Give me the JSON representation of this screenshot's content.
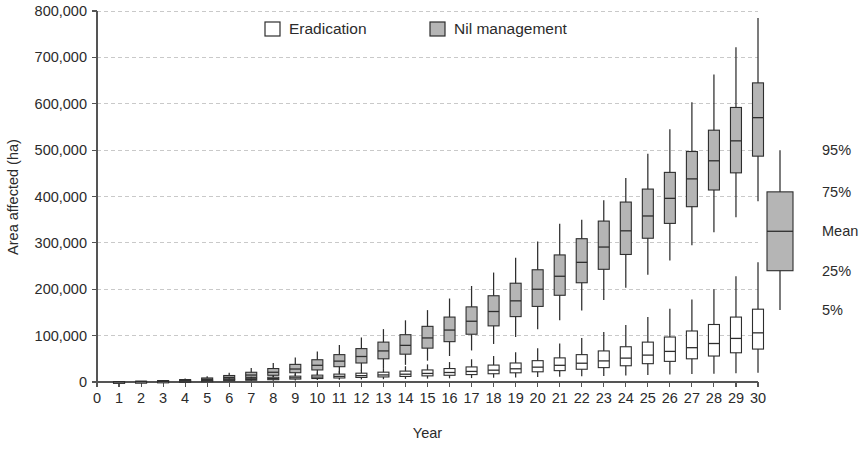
{
  "chart_data": {
    "type": "box",
    "title": "",
    "xlabel": "Year",
    "ylabel": "Area affected (ha)",
    "ylim": [
      0,
      800000
    ],
    "xlim": [
      0,
      30
    ],
    "ytick_labels": [
      "800,000",
      "700,000",
      "600,000",
      "500,000",
      "400,000",
      "300,000",
      "200,000",
      "100,000",
      "0"
    ],
    "ytick_values": [
      800000,
      700000,
      600000,
      500000,
      400000,
      300000,
      200000,
      100000,
      0
    ],
    "xtick_labels": [
      "0",
      "1",
      "2",
      "3",
      "4",
      "5",
      "6",
      "7",
      "8",
      "9",
      "10",
      "11",
      "12",
      "13",
      "14",
      "15",
      "16",
      "17",
      "18",
      "19",
      "20",
      "21",
      "22",
      "23",
      "24",
      "25",
      "26",
      "27",
      "28",
      "29",
      "30"
    ],
    "xtick_values": [
      0,
      1,
      2,
      3,
      4,
      5,
      6,
      7,
      8,
      9,
      10,
      11,
      12,
      13,
      14,
      15,
      16,
      17,
      18,
      19,
      20,
      21,
      22,
      23,
      24,
      25,
      26,
      27,
      28,
      29,
      30
    ],
    "grid": true,
    "legend_position": "top-center",
    "legend": [
      {
        "name": "Eradication",
        "fill": "#ffffff",
        "stroke": "#2e2e2e"
      },
      {
        "name": "Nil management",
        "fill": "#b5b5b5",
        "stroke": "#2e2e2e"
      }
    ],
    "key": {
      "labels": [
        "95%",
        "75%",
        "Mean",
        "25%",
        "5%"
      ],
      "fill": "#b5b5b5",
      "box_low": 240000,
      "box_high": 410000,
      "mean": 325000,
      "whisker_low": 155000,
      "whisker_high": 500000
    },
    "series": [
      {
        "name": "Nil management",
        "fill": "#b5b5b5",
        "stroke": "#2e2e2e",
        "boxes": [
          {
            "x": 1,
            "whisker_low": 200,
            "q25": 400,
            "mean": 600,
            "q75": 900,
            "whisker_high": 1300
          },
          {
            "x": 2,
            "whisker_low": 400,
            "q25": 800,
            "mean": 1200,
            "q75": 1700,
            "whisker_high": 2400
          },
          {
            "x": 3,
            "whisker_low": 700,
            "q25": 1400,
            "mean": 2100,
            "q75": 3000,
            "whisker_high": 4300
          },
          {
            "x": 4,
            "whisker_low": 1200,
            "q25": 2400,
            "mean": 3600,
            "q75": 5200,
            "whisker_high": 7500
          },
          {
            "x": 5,
            "whisker_low": 2000,
            "q25": 4000,
            "mean": 6000,
            "q75": 8700,
            "whisker_high": 12500
          },
          {
            "x": 6,
            "whisker_low": 3200,
            "q25": 6500,
            "mean": 9800,
            "q75": 14000,
            "whisker_high": 20000
          },
          {
            "x": 7,
            "whisker_low": 5000,
            "q25": 10000,
            "mean": 15000,
            "q75": 21000,
            "whisker_high": 30000
          },
          {
            "x": 8,
            "whisker_low": 7500,
            "q25": 14500,
            "mean": 21000,
            "q75": 29000,
            "whisker_high": 41000
          },
          {
            "x": 9,
            "whisker_low": 10500,
            "q25": 20000,
            "mean": 28000,
            "q75": 38000,
            "whisker_high": 53000
          },
          {
            "x": 10,
            "whisker_low": 14000,
            "q25": 26000,
            "mean": 36000,
            "q75": 48000,
            "whisker_high": 66000
          },
          {
            "x": 11,
            "whisker_low": 18500,
            "q25": 33000,
            "mean": 45000,
            "q75": 59000,
            "whisker_high": 80000
          },
          {
            "x": 12,
            "whisker_low": 24000,
            "q25": 41000,
            "mean": 55000,
            "q75": 72000,
            "whisker_high": 96000
          },
          {
            "x": 13,
            "whisker_low": 30000,
            "q25": 50000,
            "mean": 67000,
            "q75": 86000,
            "whisker_high": 114000
          },
          {
            "x": 14,
            "whisker_low": 37000,
            "q25": 60000,
            "mean": 79000,
            "q75": 102000,
            "whisker_high": 133000
          },
          {
            "x": 15,
            "whisker_low": 46000,
            "q25": 73000,
            "mean": 95000,
            "q75": 120000,
            "whisker_high": 155000
          },
          {
            "x": 16,
            "whisker_low": 56000,
            "q25": 87000,
            "mean": 112000,
            "q75": 140000,
            "whisker_high": 180000
          },
          {
            "x": 17,
            "whisker_low": 68000,
            "q25": 103000,
            "mean": 131000,
            "q75": 162000,
            "whisker_high": 207000
          },
          {
            "x": 18,
            "whisker_low": 82000,
            "q25": 121000,
            "mean": 152000,
            "q75": 186000,
            "whisker_high": 236000
          },
          {
            "x": 19,
            "whisker_low": 97000,
            "q25": 141000,
            "mean": 175000,
            "q75": 213000,
            "whisker_high": 268000
          },
          {
            "x": 20,
            "whisker_low": 114000,
            "q25": 163000,
            "mean": 200000,
            "q75": 242000,
            "whisker_high": 303000
          },
          {
            "x": 21,
            "whisker_low": 133000,
            "q25": 187000,
            "mean": 228000,
            "q75": 274000,
            "whisker_high": 341000
          },
          {
            "x": 22,
            "whisker_low": 154000,
            "q25": 214000,
            "mean": 258000,
            "q75": 309000,
            "whisker_high": 350000
          },
          {
            "x": 23,
            "whisker_low": 177000,
            "q25": 243000,
            "mean": 291000,
            "q75": 347000,
            "whisker_high": 392000
          },
          {
            "x": 24,
            "whisker_low": 203000,
            "q25": 275000,
            "mean": 326000,
            "q75": 388000,
            "whisker_high": 440000
          },
          {
            "x": 25,
            "whisker_low": 231000,
            "q25": 310000,
            "mean": 358000,
            "q75": 416000,
            "whisker_high": 492000
          },
          {
            "x": 26,
            "whisker_low": 262000,
            "q25": 342000,
            "mean": 396000,
            "q75": 452000,
            "whisker_high": 545000
          },
          {
            "x": 27,
            "whisker_low": 295000,
            "q25": 378000,
            "mean": 438000,
            "q75": 497000,
            "whisker_high": 603000
          },
          {
            "x": 28,
            "whisker_low": 323000,
            "q25": 414000,
            "mean": 477000,
            "q75": 543000,
            "whisker_high": 663000
          },
          {
            "x": 29,
            "whisker_low": 355000,
            "q25": 451000,
            "mean": 520000,
            "q75": 592000,
            "whisker_high": 722000
          },
          {
            "x": 30,
            "whisker_low": 390000,
            "q25": 487000,
            "mean": 570000,
            "q75": 645000,
            "whisker_high": 785000
          }
        ]
      },
      {
        "name": "Eradication",
        "fill": "#ffffff",
        "stroke": "#2e2e2e",
        "boxes": [
          {
            "x": 1,
            "whisker_low": 100,
            "q25": 200,
            "mean": 300,
            "q75": 450,
            "whisker_high": 650
          },
          {
            "x": 2,
            "whisker_low": 200,
            "q25": 400,
            "mean": 600,
            "q75": 850,
            "whisker_high": 1200
          },
          {
            "x": 3,
            "whisker_low": 350,
            "q25": 700,
            "mean": 1000,
            "q75": 1450,
            "whisker_high": 2100
          },
          {
            "x": 4,
            "whisker_low": 600,
            "q25": 1150,
            "mean": 1700,
            "q75": 2450,
            "whisker_high": 3500
          },
          {
            "x": 5,
            "whisker_low": 900,
            "q25": 1800,
            "mean": 2700,
            "q75": 3900,
            "whisker_high": 5600
          },
          {
            "x": 6,
            "whisker_low": 1400,
            "q25": 2700,
            "mean": 4000,
            "q75": 5800,
            "whisker_high": 8200
          },
          {
            "x": 7,
            "whisker_low": 2000,
            "q25": 3800,
            "mean": 5600,
            "q75": 8000,
            "whisker_high": 11200
          },
          {
            "x": 8,
            "whisker_low": 2700,
            "q25": 5000,
            "mean": 7300,
            "q75": 10300,
            "whisker_high": 14500
          },
          {
            "x": 9,
            "whisker_low": 3400,
            "q25": 6300,
            "mean": 9000,
            "q75": 12600,
            "whisker_high": 17500
          },
          {
            "x": 10,
            "whisker_low": 4100,
            "q25": 7500,
            "mean": 10600,
            "q75": 14800,
            "whisker_high": 20500
          },
          {
            "x": 11,
            "whisker_low": 4800,
            "q25": 8700,
            "mean": 12200,
            "q75": 17000,
            "whisker_high": 23500
          },
          {
            "x": 12,
            "whisker_low": 5500,
            "q25": 9800,
            "mean": 13700,
            "q75": 19000,
            "whisker_high": 26500
          },
          {
            "x": 13,
            "whisker_low": 6100,
            "q25": 10900,
            "mean": 15200,
            "q75": 21200,
            "whisker_high": 30000
          },
          {
            "x": 14,
            "whisker_low": 6700,
            "q25": 12000,
            "mean": 16800,
            "q75": 23500,
            "whisker_high": 34000
          },
          {
            "x": 15,
            "whisker_low": 7300,
            "q25": 13200,
            "mean": 18500,
            "q75": 26000,
            "whisker_high": 38000
          },
          {
            "x": 16,
            "whisker_low": 7900,
            "q25": 14500,
            "mean": 20500,
            "q75": 29000,
            "whisker_high": 43000
          },
          {
            "x": 17,
            "whisker_low": 8500,
            "q25": 16000,
            "mean": 22800,
            "q75": 32500,
            "whisker_high": 49000
          },
          {
            "x": 18,
            "whisker_low": 9200,
            "q25": 17800,
            "mean": 25500,
            "q75": 36500,
            "whisker_high": 56000
          },
          {
            "x": 19,
            "whisker_low": 9900,
            "q25": 19800,
            "mean": 28500,
            "q75": 41000,
            "whisker_high": 64000
          },
          {
            "x": 20,
            "whisker_low": 10600,
            "q25": 22000,
            "mean": 32000,
            "q75": 46000,
            "whisker_high": 73000
          },
          {
            "x": 21,
            "whisker_low": 11400,
            "q25": 24500,
            "mean": 36000,
            "q75": 52000,
            "whisker_high": 83000
          },
          {
            "x": 22,
            "whisker_low": 12200,
            "q25": 27500,
            "mean": 40500,
            "q75": 59000,
            "whisker_high": 95000
          },
          {
            "x": 23,
            "whisker_low": 13000,
            "q25": 31000,
            "mean": 45500,
            "q75": 67000,
            "whisker_high": 108000
          },
          {
            "x": 24,
            "whisker_low": 14000,
            "q25": 35000,
            "mean": 51500,
            "q75": 76000,
            "whisker_high": 123000
          },
          {
            "x": 25,
            "whisker_low": 15000,
            "q25": 39500,
            "mean": 58000,
            "q75": 86000,
            "whisker_high": 140000
          },
          {
            "x": 26,
            "whisker_low": 16000,
            "q25": 44500,
            "mean": 66000,
            "q75": 97000,
            "whisker_high": 158000
          },
          {
            "x": 27,
            "whisker_low": 17000,
            "q25": 50000,
            "mean": 74000,
            "q75": 110000,
            "whisker_high": 178000
          },
          {
            "x": 28,
            "whisker_low": 18000,
            "q25": 56000,
            "mean": 83000,
            "q75": 124000,
            "whisker_high": 200000
          },
          {
            "x": 29,
            "whisker_low": 19000,
            "q25": 63000,
            "mean": 94000,
            "q75": 140000,
            "whisker_high": 228000
          },
          {
            "x": 30,
            "whisker_low": 20000,
            "q25": 71000,
            "mean": 106000,
            "q75": 157000,
            "whisker_high": 258000
          }
        ]
      }
    ]
  }
}
